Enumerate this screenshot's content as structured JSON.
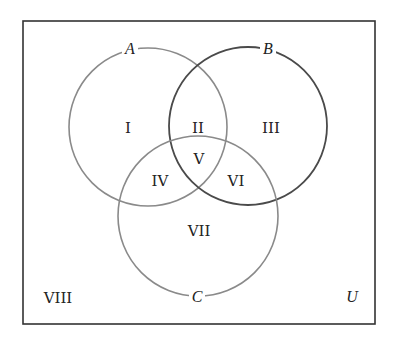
{
  "diagram": {
    "type": "venn",
    "universe_label": "U",
    "sets": [
      {
        "name": "A",
        "label": "A",
        "cx": 148,
        "cy": 127,
        "r": 79,
        "stroke": "#8a8a8a"
      },
      {
        "name": "B",
        "label": "B",
        "cx": 248,
        "cy": 126,
        "r": 79,
        "stroke": "#4a4a4a"
      },
      {
        "name": "C",
        "label": "C",
        "cx": 198,
        "cy": 216,
        "r": 80,
        "stroke": "#8a8a8a"
      }
    ],
    "regions": [
      {
        "id": "I",
        "label": "I",
        "x": 128,
        "y": 128
      },
      {
        "id": "II",
        "label": "II",
        "x": 198,
        "y": 128
      },
      {
        "id": "III",
        "label": "III",
        "x": 270,
        "y": 128
      },
      {
        "id": "V",
        "label": "V",
        "x": 198,
        "y": 162
      },
      {
        "id": "IV",
        "label": "IV",
        "x": 160,
        "y": 183
      },
      {
        "id": "VI",
        "label": "VI",
        "x": 236,
        "y": 183
      },
      {
        "id": "VII",
        "label": "VII",
        "x": 198,
        "y": 233
      },
      {
        "id": "VIII",
        "label": "VIII",
        "x": 58,
        "y": 301
      }
    ],
    "frame": {
      "x": 23,
      "y": 21,
      "width": 352,
      "height": 303,
      "stroke": "#333333"
    }
  }
}
